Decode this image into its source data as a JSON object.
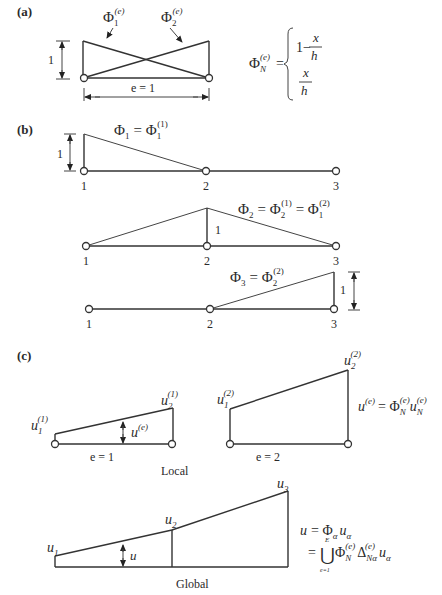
{
  "panels": {
    "a": {
      "label": "(a)",
      "phi1": {
        "base": "Φ",
        "sub": "1",
        "sup": "(e)"
      },
      "phi2": {
        "base": "Φ",
        "sub": "2",
        "sup": "(e)"
      },
      "height_label": "1",
      "length_label": "e = 1",
      "formula": {
        "lhs_base": "Φ",
        "lhs_sub": "N",
        "lhs_sup": "(e)",
        "eq": "=",
        "case1_const": "1−",
        "case1_num": "x",
        "case1_den": "h",
        "case2_num": "x",
        "case2_den": "h"
      }
    },
    "b": {
      "label": "(b)",
      "row1": {
        "height_label": "1",
        "eq": {
          "lhs": "Φ",
          "lhs_sub": "1",
          "mid": "= Φ",
          "mid_sub": "1",
          "mid_sup": "(1)"
        },
        "nodes": [
          "1",
          "2",
          "3"
        ]
      },
      "row2": {
        "height_label": "1",
        "eq": {
          "lhs": "Φ",
          "lhs_sub": "2",
          "mid": "= Φ",
          "mid_sub": "2",
          "mid_sup": "(1)",
          "end": "= Φ",
          "end_sub": "1",
          "end_sup": "(2)"
        },
        "nodes": [
          "1",
          "2",
          "3"
        ]
      },
      "row3": {
        "height_label": "1",
        "eq": {
          "lhs": "Φ",
          "lhs_sub": "3",
          "mid": "= Φ",
          "mid_sub": "2",
          "mid_sup": "(2)"
        },
        "nodes": [
          "1",
          "2",
          "3"
        ]
      }
    },
    "c": {
      "label": "(c)",
      "local": {
        "caption": "Local",
        "e1": {
          "label": "e = 1",
          "u_left": {
            "base": "u",
            "sub": "1",
            "sup": "(1)"
          },
          "u_right": {
            "base": "u",
            "sub": "2",
            "sup": "(1)"
          },
          "u_mid": {
            "base": "u",
            "sup": "(e)"
          }
        },
        "e2": {
          "label": "e = 2",
          "u_left": {
            "base": "u",
            "sub": "1",
            "sup": "(2)"
          },
          "u_right": {
            "base": "u",
            "sub": "2",
            "sup": "(2)"
          }
        },
        "formula": {
          "lhs": "u",
          "lhs_sup": "(e)",
          "eq": "= Φ",
          "phi_sub": "N",
          "phi_sup": "(e)",
          "u": "u",
          "u_sub": "N",
          "u_sup": "(e)"
        }
      },
      "global": {
        "caption": "Global",
        "u1": {
          "base": "u",
          "sub": "1"
        },
        "u2": {
          "base": "u",
          "sub": "2"
        },
        "u3": {
          "base": "u",
          "sub": "3"
        },
        "u_mid": "u",
        "formula_line1": {
          "lhs": "u",
          "eq": "= Φ",
          "phi_sub": "α",
          "u": "u",
          "u_sub": "α"
        },
        "formula_line2": {
          "eq": "=",
          "union": "⋃",
          "union_top": "E",
          "union_bottom": "e=1",
          "phi": "Φ",
          "phi_sub": "N",
          "phi_sup": "(e)",
          "delta": "Δ",
          "delta_sub": "Nα",
          "delta_sup": "(e)",
          "u": "u",
          "u_sub": "α"
        }
      }
    }
  }
}
